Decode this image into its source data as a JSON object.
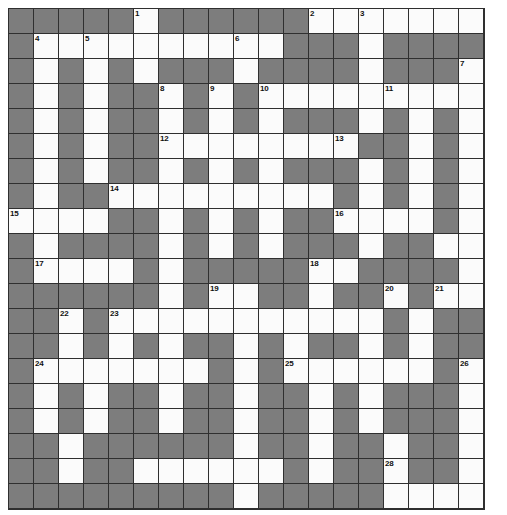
{
  "puzzle": {
    "title": "Crossword Grid",
    "type": "crossword",
    "columns": 19,
    "rows": 20,
    "cell_size": 25,
    "colors": {
      "block": "#7d7d7d",
      "open": "#fbfbfb",
      "grid_line": "#2f2f2f",
      "number_text": "#111111",
      "page_background": "#ffffff"
    },
    "clue_number_count": 29,
    "clue_numbers": [
      1,
      2,
      3,
      4,
      5,
      6,
      7,
      8,
      9,
      10,
      11,
      12,
      13,
      14,
      15,
      16,
      17,
      18,
      19,
      20,
      21,
      22,
      23,
      24,
      25,
      26,
      27,
      28,
      29
    ],
    "grid": [
      "###..#.......#.#..#....",
      "",
      ""
    ],
    "cells": [
      [
        "block",
        "block",
        "block",
        "block",
        "block",
        "open",
        "block",
        "block",
        "block",
        "block",
        "block",
        "block",
        "open",
        "open",
        "open",
        "open",
        "open",
        "open",
        "open"
      ],
      [
        "block",
        "open",
        "open",
        "open",
        "open",
        "open",
        "open",
        "open",
        "open",
        "open",
        "open",
        "block",
        "block",
        "block",
        "open",
        "block",
        "block",
        "block",
        "block"
      ],
      [
        "block",
        "open",
        "block",
        "open",
        "block",
        "open",
        "block",
        "block",
        "block",
        "open",
        "block",
        "block",
        "block",
        "block",
        "open",
        "block",
        "block",
        "block",
        "open"
      ],
      [
        "block",
        "open",
        "block",
        "open",
        "block",
        "block",
        "open",
        "block",
        "open",
        "block",
        "open",
        "open",
        "open",
        "open",
        "open",
        "open",
        "open",
        "open",
        "open"
      ],
      [
        "block",
        "open",
        "block",
        "open",
        "block",
        "block",
        "open",
        "block",
        "open",
        "block",
        "open",
        "block",
        "block",
        "block",
        "open",
        "block",
        "open",
        "block",
        "open"
      ],
      [
        "block",
        "open",
        "block",
        "open",
        "block",
        "block",
        "open",
        "open",
        "open",
        "open",
        "open",
        "open",
        "open",
        "open",
        "block",
        "block",
        "open",
        "block",
        "open"
      ],
      [
        "block",
        "open",
        "block",
        "open",
        "block",
        "block",
        "open",
        "block",
        "open",
        "block",
        "open",
        "block",
        "block",
        "block",
        "open",
        "block",
        "open",
        "block",
        "open"
      ],
      [
        "block",
        "open",
        "block",
        "block",
        "open",
        "open",
        "open",
        "open",
        "open",
        "open",
        "open",
        "open",
        "open",
        "block",
        "open",
        "block",
        "open",
        "block",
        "open"
      ],
      [
        "open",
        "open",
        "open",
        "open",
        "block",
        "block",
        "open",
        "block",
        "open",
        "block",
        "open",
        "block",
        "block",
        "open",
        "open",
        "open",
        "open",
        "block",
        "open"
      ],
      [
        "block",
        "open",
        "block",
        "block",
        "block",
        "block",
        "open",
        "block",
        "open",
        "block",
        "open",
        "block",
        "block",
        "block",
        "open",
        "block",
        "block",
        "open",
        "open"
      ],
      [
        "block",
        "open",
        "open",
        "open",
        "open",
        "block",
        "open",
        "block",
        "block",
        "block",
        "block",
        "block",
        "open",
        "open",
        "block",
        "block",
        "block",
        "block",
        "open"
      ],
      [
        "block",
        "block",
        "block",
        "block",
        "block",
        "block",
        "open",
        "block",
        "open",
        "open",
        "block",
        "block",
        "open",
        "block",
        "block",
        "open",
        "block",
        "open",
        "open"
      ],
      [
        "block",
        "block",
        "open",
        "block",
        "open",
        "open",
        "open",
        "open",
        "open",
        "open",
        "open",
        "open",
        "open",
        "open",
        "open",
        "block",
        "open",
        "block",
        "block"
      ],
      [
        "block",
        "block",
        "open",
        "block",
        "open",
        "block",
        "open",
        "block",
        "block",
        "open",
        "block",
        "open",
        "block",
        "block",
        "open",
        "block",
        "open",
        "block",
        "block"
      ],
      [
        "block",
        "open",
        "open",
        "open",
        "open",
        "open",
        "open",
        "open",
        "block",
        "open",
        "block",
        "open",
        "open",
        "open",
        "open",
        "open",
        "open",
        "block",
        "open"
      ],
      [
        "block",
        "open",
        "block",
        "open",
        "block",
        "block",
        "open",
        "block",
        "block",
        "open",
        "block",
        "block",
        "open",
        "block",
        "open",
        "block",
        "block",
        "block",
        "open"
      ],
      [
        "block",
        "open",
        "block",
        "open",
        "block",
        "block",
        "open",
        "block",
        "block",
        "open",
        "block",
        "block",
        "open",
        "block",
        "open",
        "block",
        "block",
        "block",
        "open"
      ],
      [
        "block",
        "block",
        "open",
        "block",
        "block",
        "block",
        "block",
        "block",
        "block",
        "open",
        "block",
        "block",
        "open",
        "block",
        "block",
        "open",
        "block",
        "block",
        "open"
      ],
      [
        "block",
        "block",
        "open",
        "block",
        "block",
        "open",
        "open",
        "open",
        "open",
        "open",
        "open",
        "block",
        "open",
        "block",
        "block",
        "open",
        "block",
        "block",
        "open"
      ],
      [
        "block",
        "block",
        "block",
        "block",
        "block",
        "block",
        "block",
        "block",
        "block",
        "open",
        "block",
        "block",
        "block",
        "block",
        "block",
        "open",
        "open",
        "open",
        "open"
      ]
    ],
    "numbered_cells": [
      {
        "number": 1,
        "row": 0,
        "col": 5
      },
      {
        "number": 2,
        "row": 0,
        "col": 12
      },
      {
        "number": 3,
        "row": 0,
        "col": 14
      },
      {
        "number": 4,
        "row": 1,
        "col": 1
      },
      {
        "number": 5,
        "row": 1,
        "col": 3
      },
      {
        "number": 6,
        "row": 1,
        "col": 9
      },
      {
        "number": 7,
        "row": 2,
        "col": 18
      },
      {
        "number": 8,
        "row": 3,
        "col": 6
      },
      {
        "number": 9,
        "row": 3,
        "col": 8
      },
      {
        "number": 10,
        "row": 3,
        "col": 10
      },
      {
        "number": 11,
        "row": 3,
        "col": 15
      },
      {
        "number": 12,
        "row": 5,
        "col": 6
      },
      {
        "number": 13,
        "row": 5,
        "col": 13
      },
      {
        "number": 14,
        "row": 7,
        "col": 4
      },
      {
        "number": 15,
        "row": 8,
        "col": 0
      },
      {
        "number": 16,
        "row": 8,
        "col": 13
      },
      {
        "number": 17,
        "row": 10,
        "col": 1
      },
      {
        "number": 18,
        "row": 10,
        "col": 12
      },
      {
        "number": 19,
        "row": 11,
        "col": 8
      },
      {
        "number": 20,
        "row": 11,
        "col": 15
      },
      {
        "number": 21,
        "row": 11,
        "col": 17
      },
      {
        "number": 22,
        "row": 12,
        "col": 2
      },
      {
        "number": 23,
        "row": 12,
        "col": 4
      },
      {
        "number": 24,
        "row": 14,
        "col": 1
      },
      {
        "number": 25,
        "row": 14,
        "col": 11
      },
      {
        "number": 26,
        "row": 14,
        "col": 18
      },
      {
        "number": 27,
        "row": 17,
        "col": 5
      },
      {
        "number": 28,
        "row": 18,
        "col": 15
      },
      {
        "number": 29,
        "row": 19,
        "col": 2
      }
    ]
  }
}
